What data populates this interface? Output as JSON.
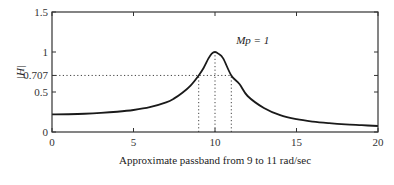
{
  "chart_data": {
    "type": "line",
    "title": "",
    "xlabel": "Approximate passband from 9 to 11 rad/sec",
    "ylabel": "|H|",
    "xlim": [
      0,
      20
    ],
    "ylim": [
      0,
      1.5
    ],
    "xticks": [
      0,
      5,
      10,
      15,
      20
    ],
    "xtick_labels": [
      "0",
      "5",
      "10",
      "15",
      "20"
    ],
    "yticks": [
      0,
      0.5,
      0.707,
      1,
      1.5
    ],
    "ytick_labels": [
      "0",
      "0.5",
      "0.707",
      "1",
      "1.5"
    ],
    "grid": false,
    "series": [
      {
        "name": "|H|",
        "x": [
          0,
          1,
          2,
          3,
          4,
          5,
          6,
          7,
          7.5,
          8,
          8.5,
          9,
          9.3,
          9.6,
          9.8,
          10,
          10.2,
          10.5,
          11,
          11.5,
          12,
          13,
          14,
          15,
          16,
          17,
          18,
          19,
          20
        ],
        "y": [
          0.22,
          0.222,
          0.228,
          0.238,
          0.253,
          0.275,
          0.31,
          0.37,
          0.42,
          0.49,
          0.58,
          0.707,
          0.8,
          0.92,
          0.98,
          1.0,
          0.98,
          0.92,
          0.707,
          0.6,
          0.45,
          0.3,
          0.21,
          0.16,
          0.13,
          0.11,
          0.095,
          0.085,
          0.075
        ]
      }
    ],
    "reference_lines": [
      {
        "orientation": "horizontal",
        "y": 0.707,
        "x_range": [
          0,
          11
        ],
        "style": "dotted"
      },
      {
        "orientation": "vertical",
        "x": 9,
        "y_range": [
          0,
          0.707
        ],
        "style": "dotted"
      },
      {
        "orientation": "vertical",
        "x": 10,
        "y_range": [
          0,
          1.0
        ],
        "style": "dotted"
      },
      {
        "orientation": "vertical",
        "x": 11,
        "y_range": [
          0,
          0.707
        ],
        "style": "dotted"
      }
    ],
    "annotations": [
      {
        "text": "Mp = 1",
        "x": 11.3,
        "y": 1.15
      }
    ]
  }
}
